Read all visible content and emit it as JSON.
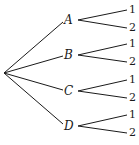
{
  "diagram": {
    "type": "tree",
    "root": {
      "x": 4,
      "y": 73
    },
    "line_color": "#1a1a1a",
    "branches": [
      {
        "label": "A",
        "x": 70,
        "y": 20,
        "leaves": [
          {
            "label": "1",
            "y": 10
          },
          {
            "label": "2",
            "y": 28
          }
        ]
      },
      {
        "label": "B",
        "x": 70,
        "y": 55,
        "leaves": [
          {
            "label": "1",
            "y": 44
          },
          {
            "label": "2",
            "y": 62
          }
        ]
      },
      {
        "label": "C",
        "x": 70,
        "y": 91,
        "leaves": [
          {
            "label": "1",
            "y": 80
          },
          {
            "label": "2",
            "y": 98
          }
        ]
      },
      {
        "label": "D",
        "x": 70,
        "y": 126,
        "leaves": [
          {
            "label": "1",
            "y": 115
          },
          {
            "label": "2",
            "y": 133
          }
        ]
      }
    ]
  }
}
